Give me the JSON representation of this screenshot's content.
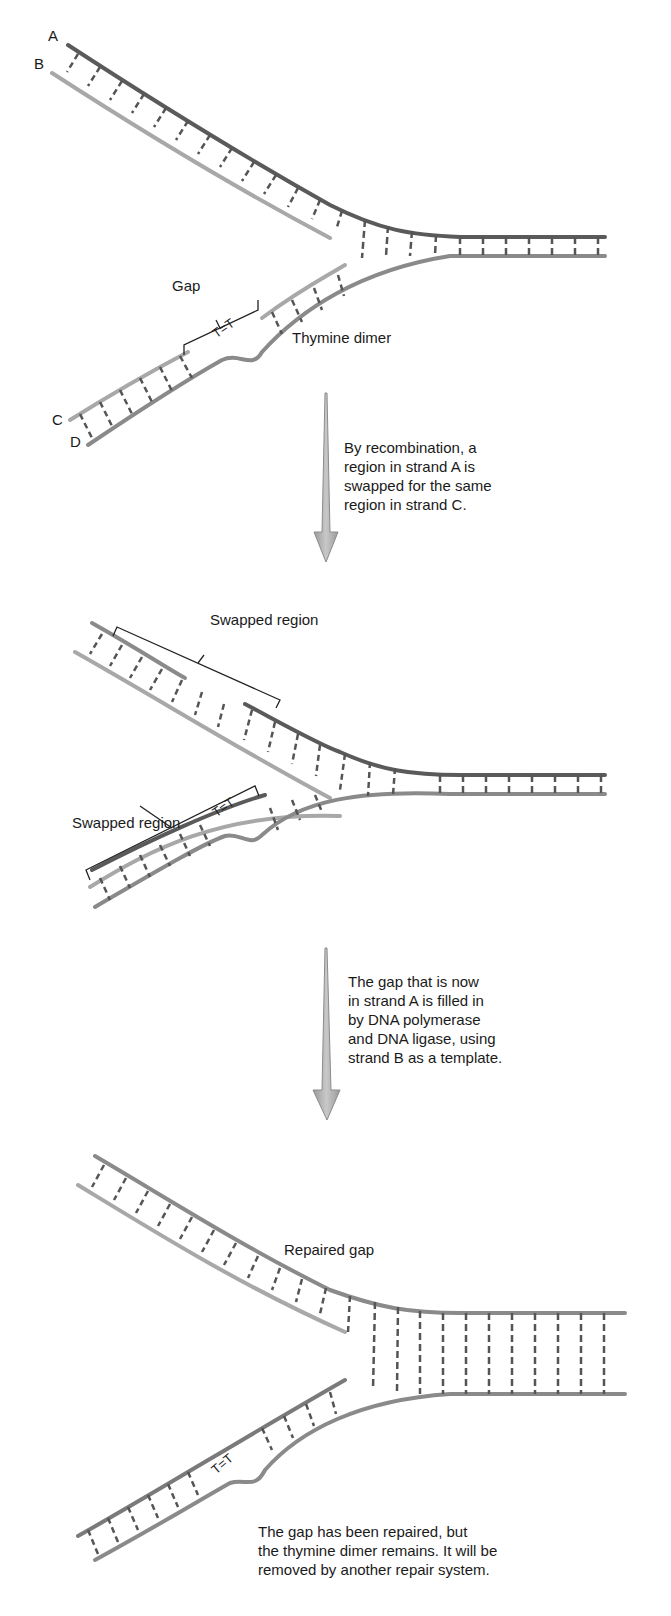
{
  "figure": {
    "panels": [
      {
        "id": "panel-1",
        "strand_labels": [
          "A",
          "B",
          "C",
          "D"
        ],
        "labels": {
          "gap": "Gap",
          "thymine_dimer": "Thymine dimer",
          "dimer_glyph": "T=T"
        }
      },
      {
        "id": "panel-2",
        "labels": {
          "swapped_top": "Swapped region",
          "swapped_bottom": "Swapped region",
          "dimer_glyph": "T=T"
        }
      },
      {
        "id": "panel-3",
        "labels": {
          "repaired_gap": "Repaired gap",
          "dimer_glyph": "T=T"
        }
      }
    ],
    "steps": [
      {
        "caption": "By recombination, a\nregion in strand A is\nswapped for the same\nregion in strand C."
      },
      {
        "caption": "The gap that is now\nin strand A is filled in\nby DNA polymerase\nand DNA ligase, using\nstrand B as a template."
      }
    ],
    "final_note": "The gap has been repaired, but\nthe thymine dimer remains. It will be\nremoved by another repair system.",
    "colors": {
      "strand_dark": "#5a5a5a",
      "strand_light": "#a8a8a8",
      "strand_mid": "#8a8a8a",
      "rung": "#555555",
      "arrow_fill": "#b4b4b4",
      "arrow_stroke": "#8c8c8c",
      "text": "#1a1a1a"
    }
  }
}
